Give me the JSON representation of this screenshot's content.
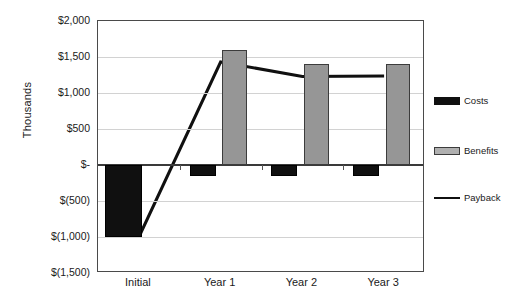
{
  "chart_data": {
    "type": "bar",
    "title": "",
    "xlabel": "",
    "ylabel": "Thousands",
    "categories": [
      "Initial",
      "Year 1",
      "Year 2",
      "Year 3"
    ],
    "ylim": [
      -1500,
      2000
    ],
    "ytick_values": [
      2000,
      1500,
      1000,
      500,
      0,
      -500,
      -1000,
      -1500
    ],
    "ytick_labels": [
      "$2,000",
      "$1,500",
      "$1,000",
      "$500",
      "$-",
      "$(500)",
      "$(1,000)",
      "$(1,500)"
    ],
    "grid": true,
    "legend_position": "right",
    "series": [
      {
        "name": "Costs",
        "type": "bar",
        "color": "#101010",
        "values": [
          -1000,
          -150,
          -150,
          -150
        ]
      },
      {
        "name": "Benefits",
        "type": "bar",
        "color": "#969696",
        "values": [
          0,
          1600,
          1400,
          1400
        ]
      },
      {
        "name": "Payback",
        "type": "line",
        "color": "#101010",
        "values": [
          -1000,
          1430,
          1230,
          1235
        ]
      }
    ]
  },
  "legend": {
    "items": [
      {
        "label": "Costs",
        "icon": "filled-square-black"
      },
      {
        "label": "Benefits",
        "icon": "filled-square-gray"
      },
      {
        "label": "Payback",
        "icon": "line-black"
      }
    ]
  }
}
